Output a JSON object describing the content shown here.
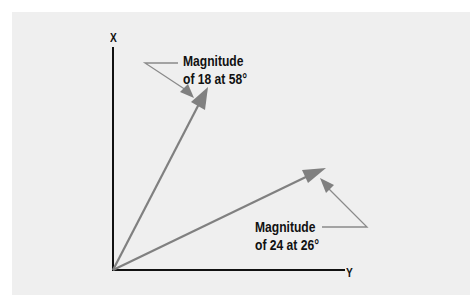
{
  "diagram": {
    "axes": {
      "vertical_label": "X",
      "horizontal_label": "Y"
    },
    "vectors": [
      {
        "name": "vector-18",
        "magnitude": 18,
        "angle_deg": 58,
        "label_line1": "Magnitude",
        "label_line2": "of 18 at 58°"
      },
      {
        "name": "vector-24",
        "magnitude": 24,
        "angle_deg": 26,
        "label_line1": "Magnitude",
        "label_line2": "of 24 at 26°"
      }
    ],
    "colors": {
      "background": "#efefef",
      "axis": "#111111",
      "vector": "#808080",
      "leader": "#8a8a8a",
      "text": "#111111"
    }
  }
}
